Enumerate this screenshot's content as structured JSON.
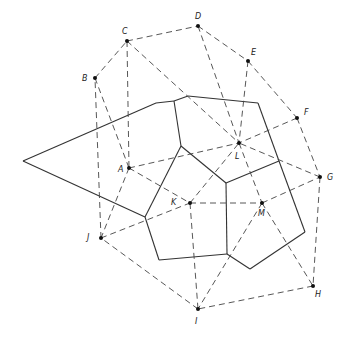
{
  "diagram": {
    "width": 350,
    "height": 338,
    "colors": {
      "solid": "#333333",
      "dashed": "#444444",
      "point": "#111111",
      "label": "#222222"
    },
    "points": [
      {
        "id": "A",
        "x": 129,
        "y": 168,
        "lx": 118,
        "ly": 172
      },
      {
        "id": "B",
        "x": 95,
        "y": 78,
        "lx": 82,
        "ly": 81
      },
      {
        "id": "C",
        "x": 127,
        "y": 41,
        "lx": 122,
        "ly": 34
      },
      {
        "id": "D",
        "x": 198,
        "y": 26,
        "lx": 195,
        "ly": 19
      },
      {
        "id": "E",
        "x": 248,
        "y": 61,
        "lx": 251,
        "ly": 55
      },
      {
        "id": "F",
        "x": 297,
        "y": 118,
        "lx": 304,
        "ly": 115
      },
      {
        "id": "G",
        "x": 320,
        "y": 177,
        "lx": 327,
        "ly": 180
      },
      {
        "id": "H",
        "x": 313,
        "y": 286,
        "lx": 315,
        "ly": 297
      },
      {
        "id": "I",
        "x": 198,
        "y": 309,
        "lx": 195,
        "ly": 324
      },
      {
        "id": "J",
        "x": 101,
        "y": 238,
        "lx": 87,
        "ly": 240
      },
      {
        "id": "K",
        "x": 190,
        "y": 203,
        "lx": 171,
        "ly": 205
      },
      {
        "id": "L",
        "x": 239,
        "y": 143,
        "lx": 235,
        "ly": 159
      },
      {
        "id": "M",
        "x": 262,
        "y": 203,
        "lx": 258,
        "ly": 216
      }
    ],
    "dashed_edges": [
      [
        "B",
        "C"
      ],
      [
        "C",
        "D"
      ],
      [
        "D",
        "E"
      ],
      [
        "E",
        "F"
      ],
      [
        "F",
        "G"
      ],
      [
        "G",
        "H"
      ],
      [
        "H",
        "I"
      ],
      [
        "I",
        "J"
      ],
      [
        "J",
        "B"
      ],
      [
        "B",
        "A"
      ],
      [
        "C",
        "A"
      ],
      [
        "C",
        "L"
      ],
      [
        "D",
        "L"
      ],
      [
        "E",
        "L"
      ],
      [
        "F",
        "L"
      ],
      [
        "G",
        "L"
      ],
      [
        "A",
        "L"
      ],
      [
        "A",
        "K"
      ],
      [
        "A",
        "J"
      ],
      [
        "J",
        "K"
      ],
      [
        "K",
        "L"
      ],
      [
        "K",
        "M"
      ],
      [
        "L",
        "M"
      ],
      [
        "M",
        "G"
      ],
      [
        "M",
        "H"
      ],
      [
        "M",
        "I"
      ],
      [
        "K",
        "I"
      ]
    ],
    "vertices": {
      "V1": [
        23,
        161
      ],
      "V2": [
        156,
        103
      ],
      "V3": [
        174,
        101
      ],
      "V4": [
        188,
        96
      ],
      "V5": [
        258,
        103
      ],
      "V6": [
        279,
        161
      ],
      "V7": [
        181,
        146
      ],
      "V8": [
        226,
        183
      ],
      "V9": [
        145,
        217
      ],
      "V10": [
        159,
        260
      ],
      "V11": [
        227,
        254
      ],
      "V12": [
        250,
        269
      ],
      "V13": [
        305,
        232
      ]
    },
    "solid_edges": [
      [
        "V1",
        "V2"
      ],
      [
        "V2",
        "V3"
      ],
      [
        "V3",
        "V4"
      ],
      [
        "V4",
        "V5"
      ],
      [
        "V5",
        "V6"
      ],
      [
        "V6",
        "V13"
      ],
      [
        "V13",
        "V12"
      ],
      [
        "V12",
        "V11"
      ],
      [
        "V11",
        "V10"
      ],
      [
        "V10",
        "V9"
      ],
      [
        "V9",
        "V1"
      ],
      [
        "V3",
        "V7"
      ],
      [
        "V7",
        "V9"
      ],
      [
        "V7",
        "V8"
      ],
      [
        "V8",
        "V6"
      ],
      [
        "V8",
        "V11"
      ]
    ]
  }
}
